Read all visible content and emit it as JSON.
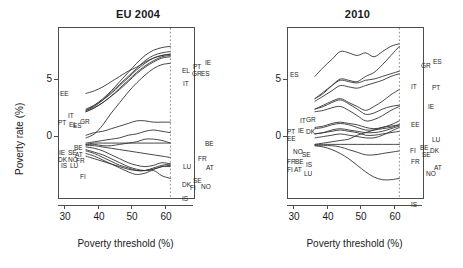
{
  "figure": {
    "axis": {
      "xlabel": "Poverty threshold (%)",
      "ylabel": "Poverty rate (%)",
      "xticks": [
        "30",
        "40",
        "50",
        "60"
      ],
      "yticks": [
        "5",
        "0"
      ]
    },
    "panels": [
      {
        "title": "EU 2004"
      },
      {
        "title": "2010"
      }
    ]
  },
  "chart_data": [
    {
      "type": "line",
      "title": "EU 2004",
      "xlabel": "Poverty threshold (%)",
      "ylabel": "Poverty rate (%)",
      "xlim": [
        27,
        67
      ],
      "ylim": [
        -4,
        9
      ],
      "xticks": [
        30,
        40,
        50,
        60
      ],
      "yticks": [
        0,
        5
      ],
      "grid": false,
      "legend": "none (series labelled at curve ends)",
      "annotations": [
        {
          "text": "60",
          "type": "vertical reference line",
          "x": 60
        }
      ],
      "left_labels": [
        "EE",
        "IT",
        "PT",
        "EL",
        "ES",
        "GR",
        "BE",
        "IE",
        "SE",
        "AT",
        "DK",
        "NO",
        "FR",
        "IS",
        "LU",
        "FI"
      ],
      "right_labels": [
        "IE",
        "PT",
        "EL",
        "GR",
        "ES",
        "IT",
        "BE",
        "FR",
        "LU",
        "AT",
        "DK",
        "SE",
        "FI",
        "NO",
        "IS"
      ],
      "x": [
        35,
        37.5,
        40,
        42.5,
        45,
        47.5,
        50,
        52.5,
        55,
        57.5,
        60
      ],
      "series": [
        {
          "name": "IE",
          "values": [
            2.7,
            3.1,
            3.6,
            4.2,
            4.9,
            5.6,
            6.3,
            6.9,
            7.3,
            7.5,
            7.6
          ]
        },
        {
          "name": "PT",
          "values": [
            2.7,
            3.0,
            3.5,
            4.1,
            4.7,
            5.3,
            5.9,
            6.5,
            6.9,
            7.1,
            7.2
          ]
        },
        {
          "name": "EL",
          "values": [
            2.8,
            3.1,
            3.5,
            4.0,
            4.6,
            5.2,
            5.8,
            6.3,
            6.7,
            6.9,
            7.0
          ]
        },
        {
          "name": "GR",
          "values": [
            2.6,
            2.9,
            3.3,
            3.8,
            4.4,
            5.0,
            5.6,
            6.1,
            6.5,
            6.8,
            6.9
          ]
        },
        {
          "name": "ES",
          "values": [
            2.6,
            2.9,
            3.3,
            3.8,
            4.3,
            4.9,
            5.5,
            6.0,
            6.4,
            6.7,
            6.8
          ]
        },
        {
          "name": "EE",
          "values": [
            4.0,
            4.2,
            4.5,
            4.9,
            5.3,
            5.7,
            6.0,
            6.4,
            6.7,
            6.9,
            7.0
          ]
        },
        {
          "name": "IT",
          "values": [
            0.6,
            0.9,
            1.6,
            2.5,
            3.3,
            4.1,
            4.8,
            5.4,
            5.9,
            6.2,
            6.3
          ]
        },
        {
          "name": "BE",
          "values": [
            0.8,
            1.0,
            1.1,
            1.3,
            1.5,
            1.7,
            1.9,
            1.9,
            1.8,
            1.8,
            1.8
          ]
        },
        {
          "name": "FR",
          "values": [
            0.2,
            0.3,
            0.4,
            0.5,
            0.6,
            0.8,
            0.9,
            1.1,
            1.2,
            1.1,
            1.0
          ]
        },
        {
          "name": "LU",
          "values": [
            0.1,
            0.2,
            0.2,
            0.2,
            0.2,
            0.2,
            0.2,
            0.2,
            0.2,
            0.2,
            0.2
          ]
        },
        {
          "name": "AT",
          "values": [
            0.1,
            0.1,
            0.0,
            0.0,
            0.1,
            0.2,
            0.3,
            0.5,
            0.5,
            0.4,
            0.2
          ]
        },
        {
          "name": "IE2",
          "values": [
            0.0,
            0.0,
            -0.1,
            -0.2,
            -0.3,
            -0.4,
            -0.5,
            -0.6,
            -0.7,
            -0.8,
            -0.9
          ]
        },
        {
          "name": "SE",
          "values": [
            -0.1,
            -0.2,
            -0.4,
            -0.7,
            -1.0,
            -1.3,
            -1.5,
            -1.6,
            -1.5,
            -1.3,
            -1.4
          ]
        },
        {
          "name": "DK",
          "values": [
            -0.3,
            -0.5,
            -0.7,
            -1.0,
            -1.3,
            -1.6,
            -1.8,
            -1.9,
            -1.8,
            -1.6,
            -1.6
          ]
        },
        {
          "name": "NO",
          "values": [
            -0.4,
            -0.6,
            -0.9,
            -1.2,
            -1.5,
            -1.7,
            -1.9,
            -1.9,
            -1.7,
            -1.5,
            -1.4
          ]
        },
        {
          "name": "FI",
          "values": [
            -0.8,
            -1.0,
            -1.2,
            -1.4,
            -1.6,
            -1.8,
            -1.9,
            -1.9,
            -1.8,
            -1.6,
            -1.5
          ]
        },
        {
          "name": "IS",
          "values": [
            -0.6,
            -0.8,
            -1.1,
            -1.4,
            -1.7,
            -2.0,
            -2.2,
            -2.1,
            -1.9,
            -2.3,
            -2.5
          ]
        }
      ]
    },
    {
      "type": "line",
      "title": "2010",
      "xlabel": "Poverty threshold (%)",
      "ylabel": "Poverty rate (%)",
      "xlim": [
        27,
        67
      ],
      "ylim": [
        -4,
        9
      ],
      "xticks": [
        30,
        40,
        50,
        60
      ],
      "yticks": [
        0,
        5
      ],
      "grid": false,
      "legend": "none (series labelled at curve ends)",
      "annotations": [
        {
          "text": "60",
          "type": "vertical reference line",
          "x": 60
        }
      ],
      "left_labels": [
        "ES",
        "IT",
        "GR",
        "PT",
        "IE",
        "DK",
        "EE",
        "NO",
        "SE",
        "FR",
        "BE",
        "IS",
        "FI",
        "AT",
        "LU"
      ],
      "right_labels": [
        "GR",
        "ES",
        "IT",
        "PT",
        "IE",
        "EE",
        "LU",
        "FI",
        "BE",
        "SE",
        "DK",
        "FR",
        "AT",
        "NO",
        "IS"
      ],
      "x": [
        35,
        37.5,
        40,
        42.5,
        45,
        47.5,
        50,
        52.5,
        55,
        57.5,
        60
      ],
      "series": [
        {
          "name": "ES",
          "values": [
            5.3,
            6.0,
            6.6,
            7.2,
            7.1,
            6.9,
            7.1,
            6.8,
            7.2,
            7.6,
            7.8
          ]
        },
        {
          "name": "GR",
          "values": [
            3.6,
            4.0,
            4.6,
            5.1,
            5.0,
            4.9,
            5.3,
            5.6,
            6.2,
            6.9,
            7.6
          ]
        },
        {
          "name": "IT",
          "values": [
            3.6,
            4.1,
            4.6,
            5.0,
            4.9,
            4.8,
            5.0,
            5.1,
            5.3,
            5.5,
            5.7
          ]
        },
        {
          "name": "PT",
          "values": [
            3.4,
            3.8,
            4.2,
            4.6,
            4.5,
            4.4,
            4.6,
            4.8,
            5.0,
            5.3,
            5.5
          ]
        },
        {
          "name": "IE",
          "values": [
            2.8,
            3.1,
            3.4,
            3.6,
            3.3,
            3.0,
            2.7,
            3.0,
            3.4,
            3.9,
            4.3
          ]
        },
        {
          "name": "DK",
          "values": [
            2.8,
            3.0,
            3.3,
            3.5,
            3.2,
            2.8,
            2.4,
            2.5,
            2.8,
            3.0,
            3.1
          ]
        },
        {
          "name": "EE",
          "values": [
            2.6,
            2.7,
            2.9,
            3.0,
            2.7,
            2.3,
            1.9,
            2.0,
            2.3,
            2.7,
            3.0
          ]
        },
        {
          "name": "NO",
          "values": [
            1.4,
            1.5,
            1.7,
            1.8,
            1.7,
            1.6,
            1.4,
            1.3,
            1.4,
            1.6,
            1.9
          ]
        },
        {
          "name": "SE",
          "values": [
            1.3,
            1.4,
            1.6,
            1.7,
            1.6,
            1.4,
            1.2,
            1.2,
            1.3,
            1.4,
            1.6
          ]
        },
        {
          "name": "BE",
          "values": [
            0.9,
            1.0,
            1.2,
            1.3,
            1.2,
            1.1,
            1.0,
            1.0,
            1.1,
            1.3,
            1.5
          ]
        },
        {
          "name": "FR",
          "values": [
            0.9,
            1.0,
            1.1,
            1.2,
            1.1,
            1.0,
            0.8,
            0.8,
            0.9,
            1.0,
            1.1
          ]
        },
        {
          "name": "IS",
          "values": [
            0.6,
            0.7,
            0.8,
            0.9,
            0.8,
            0.7,
            0.6,
            0.6,
            0.8,
            1.1,
            1.4
          ]
        },
        {
          "name": "FI",
          "values": [
            0.1,
            0.2,
            0.3,
            0.4,
            0.5,
            0.8,
            1.0,
            1.2,
            1.4,
            1.5,
            1.6
          ]
        },
        {
          "name": "AT",
          "values": [
            0.1,
            0.1,
            0.1,
            0.1,
            0.1,
            0.1,
            0.1,
            0.1,
            0.1,
            0.1,
            0.1
          ]
        },
        {
          "name": "LU",
          "values": [
            0.0,
            0.0,
            0.0,
            -0.1,
            -0.3,
            -0.5,
            -0.7,
            -0.7,
            -0.6,
            -0.5,
            -0.4
          ]
        },
        {
          "name": "IS2",
          "values": [
            0.0,
            -0.1,
            -0.3,
            -0.6,
            -1.0,
            -1.5,
            -2.0,
            -2.4,
            -2.6,
            -2.6,
            -2.5
          ]
        }
      ]
    }
  ],
  "labels": {
    "left_panel": {
      "left_side": [
        {
          "text": "EE",
          "x": 2,
          "y": 63
        },
        {
          "text": "IT",
          "x": 10,
          "y": 85
        },
        {
          "text": "PT",
          "x": 0,
          "y": 92
        },
        {
          "text": "EL",
          "x": 11,
          "y": 94
        },
        {
          "text": "ES",
          "x": 15,
          "y": 95
        },
        {
          "text": "GR",
          "x": 22,
          "y": 91
        },
        {
          "text": "BE",
          "x": 16,
          "y": 117
        },
        {
          "text": "IE",
          "x": 1,
          "y": 122
        },
        {
          "text": "SE",
          "x": 10,
          "y": 122
        },
        {
          "text": "AT",
          "x": 17,
          "y": 124
        },
        {
          "text": "DK",
          "x": 0,
          "y": 129
        },
        {
          "text": "NO",
          "x": 10,
          "y": 129
        },
        {
          "text": "FR",
          "x": 18,
          "y": 130
        },
        {
          "text": "IS",
          "x": 3,
          "y": 135
        },
        {
          "text": "LU",
          "x": 12,
          "y": 135
        },
        {
          "text": "FI",
          "x": 22,
          "y": 146
        }
      ],
      "right_side": [
        {
          "text": "IE",
          "x": 147,
          "y": 32
        },
        {
          "text": "PT",
          "x": 135,
          "y": 36
        },
        {
          "text": "EL",
          "x": 124,
          "y": 40
        },
        {
          "text": "GR",
          "x": 134,
          "y": 43
        },
        {
          "text": "ES",
          "x": 143,
          "y": 43
        },
        {
          "text": "IT",
          "x": 125,
          "y": 53
        },
        {
          "text": "BE",
          "x": 147,
          "y": 113
        },
        {
          "text": "FR",
          "x": 140,
          "y": 128
        },
        {
          "text": "LU",
          "x": 125,
          "y": 136
        },
        {
          "text": "AT",
          "x": 148,
          "y": 137
        },
        {
          "text": "DK",
          "x": 124,
          "y": 154
        },
        {
          "text": "SE",
          "x": 135,
          "y": 150
        },
        {
          "text": "FI",
          "x": 132,
          "y": 157
        },
        {
          "text": "NO",
          "x": 143,
          "y": 156
        },
        {
          "text": "IS",
          "x": 124,
          "y": 168
        }
      ]
    },
    "right_panel": {
      "left_side": [
        {
          "text": "ES",
          "x": 3,
          "y": 44
        },
        {
          "text": "IT",
          "x": 13,
          "y": 90
        },
        {
          "text": "GR",
          "x": 19,
          "y": 89
        },
        {
          "text": "PT",
          "x": 0,
          "y": 101
        },
        {
          "text": "EE",
          "x": 0,
          "y": 108
        },
        {
          "text": "IE",
          "x": 11,
          "y": 100
        },
        {
          "text": "DK",
          "x": 19,
          "y": 101
        },
        {
          "text": "NO",
          "x": 6,
          "y": 121
        },
        {
          "text": "SE",
          "x": 15,
          "y": 124
        },
        {
          "text": "FR",
          "x": 0,
          "y": 131
        },
        {
          "text": "BE",
          "x": 8,
          "y": 131
        },
        {
          "text": "IS",
          "x": 19,
          "y": 134
        },
        {
          "text": "FI",
          "x": 0,
          "y": 139
        },
        {
          "text": "AT",
          "x": 7,
          "y": 139
        },
        {
          "text": "LU",
          "x": 17,
          "y": 143
        }
      ],
      "right_side": [
        {
          "text": "ES",
          "x": 146,
          "y": 31
        },
        {
          "text": "GR",
          "x": 134,
          "y": 35
        },
        {
          "text": "IT",
          "x": 124,
          "y": 56
        },
        {
          "text": "PT",
          "x": 145,
          "y": 57
        },
        {
          "text": "IE",
          "x": 141,
          "y": 76
        },
        {
          "text": "EE",
          "x": 124,
          "y": 94
        },
        {
          "text": "LU",
          "x": 145,
          "y": 109
        },
        {
          "text": "FI",
          "x": 123,
          "y": 120
        },
        {
          "text": "BE",
          "x": 133,
          "y": 117
        },
        {
          "text": "SE",
          "x": 135,
          "y": 124
        },
        {
          "text": "DK",
          "x": 143,
          "y": 120
        },
        {
          "text": "FR",
          "x": 124,
          "y": 131
        },
        {
          "text": "AT",
          "x": 147,
          "y": 137
        },
        {
          "text": "NO",
          "x": 139,
          "y": 143
        },
        {
          "text": "IS",
          "x": 124,
          "y": 174
        }
      ]
    }
  }
}
